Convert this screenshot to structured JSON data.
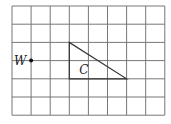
{
  "diagram": {
    "grid": {
      "cols": 8,
      "rows": 6,
      "origin_x": 12,
      "origin_y": 6,
      "cell_w": 19.1,
      "cell_h": 18.2,
      "line_color": "#777777"
    },
    "point": {
      "label": "W",
      "col": 1,
      "row": 3,
      "color": "#111111"
    },
    "shape": {
      "label": "C",
      "type": "right-triangle",
      "vertices": [
        [
          3,
          2
        ],
        [
          3,
          4
        ],
        [
          6,
          4
        ]
      ],
      "stroke": "#333333"
    }
  }
}
